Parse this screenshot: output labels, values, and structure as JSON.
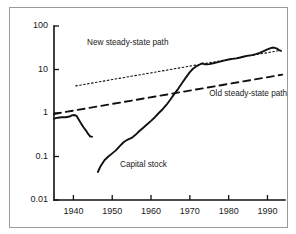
{
  "chart_data": {
    "type": "line",
    "title": "",
    "xlabel": "",
    "ylabel": "",
    "grid": false,
    "yscale": "log",
    "xlim": [
      1935,
      1994
    ],
    "ylim": [
      0.01,
      100
    ],
    "ytick_labels": [
      "100",
      "10",
      "1",
      "0.1",
      "0.01"
    ],
    "ytick_values": [
      100,
      10,
      1,
      0.1,
      0.01
    ],
    "xtick_labels": [
      "1940",
      "1950",
      "1960",
      "1970",
      "1980",
      "1990"
    ],
    "xtick_values": [
      1940,
      1950,
      1960,
      1970,
      1980,
      1990
    ],
    "legend_position": "inline-annotations",
    "annotations": [
      {
        "name": "new-steady-state-path-label",
        "text": "New steady-state path",
        "x": 1943.5,
        "y": 38
      },
      {
        "name": "old-steady-state-path-label",
        "text": "Old steady-state path",
        "x": 1975.0,
        "y": 2.6
      },
      {
        "name": "capital-stock-label",
        "text": "Capital stock",
        "x": 1952.0,
        "y": 0.062
      }
    ],
    "series": [
      {
        "name": "Capital stock (prewar)",
        "style": "solid",
        "points": [
          [
            1935.0,
            0.74
          ],
          [
            1936.0,
            0.78
          ],
          [
            1937.0,
            0.8
          ],
          [
            1938.0,
            0.8
          ],
          [
            1939.0,
            0.83
          ],
          [
            1939.6,
            0.88
          ],
          [
            1940.2,
            0.9
          ],
          [
            1940.8,
            0.86
          ],
          [
            1941.4,
            0.7
          ],
          [
            1942.0,
            0.57
          ],
          [
            1942.6,
            0.47
          ],
          [
            1943.2,
            0.4
          ],
          [
            1943.8,
            0.33
          ],
          [
            1944.3,
            0.29
          ],
          [
            1944.8,
            0.285
          ]
        ]
      },
      {
        "name": "Capital stock",
        "style": "solid",
        "points": [
          [
            1946.3,
            0.044
          ],
          [
            1947.0,
            0.06
          ],
          [
            1948.0,
            0.082
          ],
          [
            1949.0,
            0.1
          ],
          [
            1950.0,
            0.118
          ],
          [
            1951.0,
            0.14
          ],
          [
            1952.0,
            0.175
          ],
          [
            1953.0,
            0.215
          ],
          [
            1954.0,
            0.245
          ],
          [
            1955.0,
            0.268
          ],
          [
            1956.0,
            0.315
          ],
          [
            1957.0,
            0.385
          ],
          [
            1958.0,
            0.46
          ],
          [
            1959.0,
            0.55
          ],
          [
            1960.0,
            0.66
          ],
          [
            1961.0,
            0.8
          ],
          [
            1962.0,
            1.0
          ],
          [
            1963.0,
            1.22
          ],
          [
            1964.0,
            1.55
          ],
          [
            1965.0,
            2.05
          ],
          [
            1966.0,
            2.75
          ],
          [
            1967.0,
            3.6
          ],
          [
            1968.0,
            4.9
          ],
          [
            1969.0,
            6.6
          ],
          [
            1970.0,
            8.7
          ],
          [
            1970.8,
            10.4
          ],
          [
            1971.5,
            11.6
          ],
          [
            1972.2,
            12.5
          ],
          [
            1972.8,
            13.4
          ],
          [
            1973.3,
            13.9
          ],
          [
            1973.8,
            13.2
          ],
          [
            1974.4,
            13.1
          ],
          [
            1975.0,
            13.3
          ],
          [
            1976.0,
            13.9
          ],
          [
            1977.0,
            14.6
          ],
          [
            1978.0,
            15.4
          ],
          [
            1979.0,
            16.2
          ],
          [
            1980.0,
            17.0
          ],
          [
            1981.0,
            17.6
          ],
          [
            1982.0,
            18.0
          ],
          [
            1983.0,
            18.9
          ],
          [
            1984.0,
            19.9
          ],
          [
            1985.0,
            20.8
          ],
          [
            1986.0,
            21.4
          ],
          [
            1987.0,
            22.6
          ],
          [
            1988.0,
            24.2
          ],
          [
            1989.0,
            26.5
          ],
          [
            1990.0,
            29.0
          ],
          [
            1991.0,
            31.5
          ],
          [
            1991.6,
            32.0
          ],
          [
            1992.3,
            30.5
          ],
          [
            1993.0,
            28.0
          ],
          [
            1993.5,
            26.8
          ]
        ]
      },
      {
        "name": "New steady-state path",
        "style": "dotted",
        "points": [
          [
            1940.6,
            4.2
          ],
          [
            1993.4,
            27.5
          ]
        ]
      },
      {
        "name": "Old steady-state path",
        "style": "dashed",
        "points": [
          [
            1935.0,
            0.95
          ],
          [
            1993.8,
            7.6
          ]
        ]
      }
    ]
  },
  "colors": {
    "line": "#111111",
    "frame": "#9a9a9a",
    "axis": "#111111",
    "background": "#ffffff",
    "text": "#1a1a1a"
  }
}
